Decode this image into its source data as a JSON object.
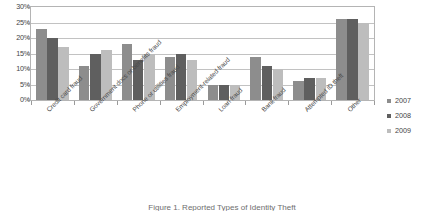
{
  "chart_data": {
    "type": "bar",
    "title": "",
    "xlabel": "",
    "ylabel": "",
    "ylim": [
      0,
      30
    ],
    "ytick_labels": [
      "30%",
      "25%",
      "20%",
      "15%",
      "10%",
      "5%",
      "0%"
    ],
    "ytick_values": [
      30,
      25,
      20,
      15,
      10,
      5,
      0
    ],
    "grid": true,
    "legend_position": "right",
    "categories": [
      "Credit card fraud",
      "Government docs or benefits fraud",
      "Phone or utilities fraud",
      "Employment-related fraud",
      "Loan fraud",
      "Bank fraud",
      "Attempted ID theft",
      "Other"
    ],
    "series": [
      {
        "name": "2007",
        "color": "#8d8d8d",
        "values": [
          23,
          11,
          18,
          14,
          5,
          14,
          6,
          26
        ]
      },
      {
        "name": "2008",
        "color": "#5f5f5f",
        "values": [
          20,
          15,
          13,
          15,
          5,
          11,
          7,
          26
        ]
      },
      {
        "name": "2009",
        "color": "#bdbdbd",
        "values": [
          17,
          16,
          15,
          13,
          5,
          10,
          7,
          25
        ]
      }
    ]
  },
  "caption": {
    "text": "Figure 1. Reported Types of Identity Theft"
  }
}
